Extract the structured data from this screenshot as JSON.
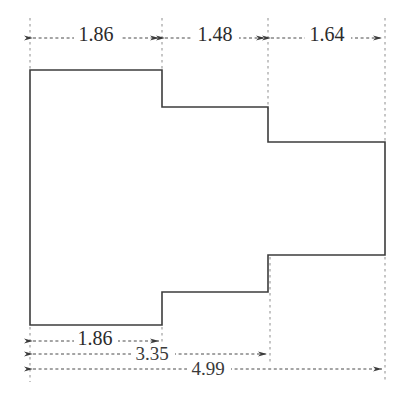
{
  "drawing": {
    "title": "Stepped polygon floor plan with dimension chains",
    "units": "meters",
    "line_color": "#3c3c3c",
    "dim_color": "#4a4a4a",
    "text_color": "#2b2b2b",
    "background": "#ffffff"
  },
  "outline": {
    "name": "stepped-polygon",
    "points": "30,70 162,70 162,107 268,107 268,142 385,142 385,255 268,255 268,292 162,292 162,325 30,325"
  },
  "top_dimensions": [
    {
      "label": "1.86",
      "x1": 30,
      "x2": 162,
      "y": 38,
      "text_x": 96,
      "text_y": 36
    },
    {
      "label": "1.48",
      "x1": 162,
      "x2": 268,
      "y": 38,
      "text_x": 215,
      "text_y": 36
    },
    {
      "label": "1.64",
      "x1": 268,
      "x2": 385,
      "y": 38,
      "text_x": 327,
      "text_y": 36
    }
  ],
  "bottom_dimensions": [
    {
      "label": "1.86",
      "x1": 30,
      "x2": 162,
      "y": 341,
      "text_x": 95,
      "text_y": 340
    },
    {
      "label": "3.35",
      "x1": 30,
      "x2": 270,
      "y": 354,
      "text_x": 152,
      "text_y": 356
    },
    {
      "label": "4.99",
      "x1": 30,
      "x2": 385,
      "y": 369,
      "text_x": 208,
      "text_y": 371
    }
  ],
  "extension_lines": [
    {
      "x": 30,
      "y1": 18,
      "y2": 70,
      "name": "ext-top-left"
    },
    {
      "x": 162,
      "y1": 18,
      "y2": 70,
      "name": "ext-top-1"
    },
    {
      "x": 268,
      "y1": 18,
      "y2": 107,
      "name": "ext-top-2"
    },
    {
      "x": 385,
      "y1": 18,
      "y2": 142,
      "name": "ext-top-right"
    },
    {
      "x": 30,
      "y1": 325,
      "y2": 382,
      "name": "ext-bot-left"
    },
    {
      "x": 162,
      "y1": 325,
      "y2": 350,
      "name": "ext-bot-1"
    },
    {
      "x": 270,
      "y1": 255,
      "y2": 362,
      "name": "ext-bot-2"
    },
    {
      "x": 385,
      "y1": 255,
      "y2": 382,
      "name": "ext-bot-right"
    }
  ]
}
